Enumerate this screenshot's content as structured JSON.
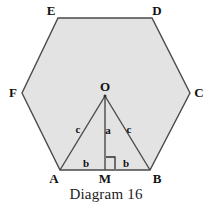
{
  "figure": {
    "caption": "Diagram 16",
    "shape_name": "regular-hexagon",
    "fill_color": "#e3e3e3",
    "stroke_color": "#4a4a4a",
    "label_color": "#121212",
    "background_color": "#ffffff"
  },
  "vertices": [
    {
      "id": "E",
      "label": "E",
      "x": 58,
      "y": 18,
      "label_x": 44,
      "label_y": 4
    },
    {
      "id": "D",
      "label": "D",
      "x": 152,
      "y": 18,
      "label_x": 150,
      "label_y": 4
    },
    {
      "id": "C",
      "label": "C",
      "x": 190,
      "y": 93,
      "label_x": 192,
      "label_y": 86
    },
    {
      "id": "B",
      "label": "B",
      "x": 150,
      "y": 170,
      "label_x": 150,
      "label_y": 172
    },
    {
      "id": "A",
      "label": "A",
      "x": 60,
      "y": 170,
      "label_x": 47,
      "label_y": 172
    },
    {
      "id": "F",
      "label": "F",
      "x": 22,
      "y": 93,
      "label_x": 6,
      "label_y": 86
    }
  ],
  "interior_points": [
    {
      "id": "O",
      "label": "O",
      "x": 105,
      "y": 96,
      "label_x": 98,
      "label_y": 80
    },
    {
      "id": "M",
      "label": "M",
      "x": 105,
      "y": 170,
      "label_x": 98,
      "label_y": 172
    }
  ],
  "segments": [
    {
      "id": "OA",
      "from": "O",
      "to": "A",
      "label": "c",
      "label_x": 73,
      "label_y": 124
    },
    {
      "id": "OM",
      "from": "O",
      "to": "M",
      "label": "a",
      "label_x": 103,
      "label_y": 125
    },
    {
      "id": "OB",
      "from": "O",
      "to": "B",
      "label": "c",
      "label_x": 124,
      "label_y": 124
    },
    {
      "id": "AM",
      "from": "A",
      "to": "M",
      "label": "b",
      "label_x": 81,
      "label_y": 158
    },
    {
      "id": "MB",
      "from": "M",
      "to": "B",
      "label": "b",
      "label_x": 121,
      "label_y": 158
    }
  ],
  "angle_marks": [
    {
      "id": "right-angle-at-M",
      "type": "right-angle",
      "at": "M",
      "x": 106,
      "y": 157,
      "size": 9
    }
  ]
}
